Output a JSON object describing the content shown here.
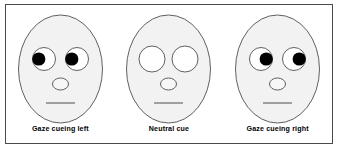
{
  "figure": {
    "type": "gaze-cueing-stimuli-diagram",
    "border_color": "#4a4a4a",
    "background_color": "#ffffff"
  },
  "style": {
    "face_fill": "#f2f2f2",
    "face_stroke": "#3a3a3a",
    "eye_fill": "#ffffff",
    "eye_stroke": "#3a3a3a",
    "pupil_fill": "#000000",
    "nose_fill": "#f7f7f7",
    "nose_stroke": "#3a3a3a",
    "mouth_stroke": "#3a3a3a",
    "label_color": "#000000"
  },
  "faces": [
    {
      "id": "gaze-left",
      "label": "Gaze cueing left",
      "gaze_direction": "left",
      "has_pupils": true,
      "eye_radius_x": 11.5,
      "eye_radius_y": 11.5,
      "pupil_radius": 6.6,
      "pupil_offset_x": -5.2,
      "left_eye_cx": 33,
      "right_eye_cx": 66,
      "eye_cy": 50,
      "nose_cx": 49.5,
      "nose_cy": 75,
      "nose_rx": 8,
      "nose_ry": 6,
      "mouth_x1": 35,
      "mouth_x2": 64,
      "mouth_y": 94
    },
    {
      "id": "neutral",
      "label": "Neutral cue",
      "gaze_direction": "none",
      "has_pupils": false,
      "eye_radius_x": 13,
      "eye_radius_y": 13,
      "pupil_radius": 0,
      "pupil_offset_x": 0,
      "left_eye_cx": 33,
      "right_eye_cx": 66,
      "eye_cy": 50,
      "nose_cx": 49.5,
      "nose_cy": 75,
      "nose_rx": 8,
      "nose_ry": 6,
      "mouth_x1": 35,
      "mouth_x2": 64,
      "mouth_y": 94
    },
    {
      "id": "gaze-right",
      "label": "Gaze cueing right",
      "gaze_direction": "right",
      "has_pupils": true,
      "eye_radius_x": 11.5,
      "eye_radius_y": 11.5,
      "pupil_radius": 6.6,
      "pupil_offset_x": 5.2,
      "left_eye_cx": 33,
      "right_eye_cx": 66,
      "eye_cy": 50,
      "nose_cx": 49.5,
      "nose_cy": 75,
      "nose_rx": 8,
      "nose_ry": 6,
      "mouth_x1": 35,
      "mouth_x2": 64,
      "mouth_y": 94
    }
  ],
  "head_shape": {
    "cx": 49.5,
    "cy": 60,
    "rx": 42,
    "ry": 54
  }
}
